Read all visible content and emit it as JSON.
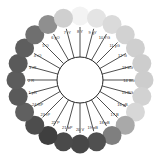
{
  "diagram": {
    "type": "color-circle",
    "center": {
      "x": 80,
      "y": 80,
      "r": 23
    },
    "ring_radius": 64,
    "swatch_radius": 9.5,
    "label_radius": 49,
    "hues": [
      {
        "label": "8 Y",
        "color": "#f3f3f3"
      },
      {
        "label": "9 gY",
        "color": "#e4e4e4"
      },
      {
        "label": "10 YG",
        "color": "#dadada"
      },
      {
        "label": "11 yG",
        "color": "#d2d2d2"
      },
      {
        "label": "12 G",
        "color": "#cfcfcf"
      },
      {
        "label": "13 bG",
        "color": "#cdcdcd"
      },
      {
        "label": "14 BG",
        "color": "#cdcdcd"
      },
      {
        "label": "15 BG",
        "color": "#d2d2d2"
      },
      {
        "label": "16 gB",
        "color": "#d7d7d7"
      },
      {
        "label": "17 B",
        "color": "#a9a9a9"
      },
      {
        "label": "18 pB",
        "color": "#7f7f7f"
      },
      {
        "label": "19 pB",
        "color": "#505050"
      },
      {
        "label": "20 V",
        "color": "#474747"
      },
      {
        "label": "21 bP",
        "color": "#4a4a4a"
      },
      {
        "label": "22 P",
        "color": "#3f3f3f"
      },
      {
        "label": "23 rP",
        "color": "#4d4d4d"
      },
      {
        "label": "24 RP",
        "color": "#606060"
      },
      {
        "label": "1 pR",
        "color": "#5a5a5a"
      },
      {
        "label": "2 R",
        "color": "#5c5c5c"
      },
      {
        "label": "3 rR",
        "color": "#5a5a5a"
      },
      {
        "label": "4 rO",
        "color": "#5e5e5e"
      },
      {
        "label": "5 O",
        "color": "#6f6f6f"
      },
      {
        "label": "6 yO",
        "color": "#8f8f8f"
      },
      {
        "label": "7 rY",
        "color": "#cfcfcf"
      }
    ]
  }
}
